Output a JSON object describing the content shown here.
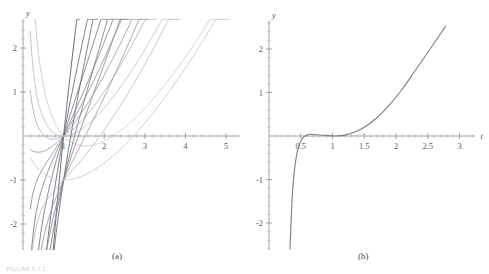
{
  "figure": {
    "caption_a": "(a)",
    "caption_b": "(b)",
    "footnote": "FIGURE 9.1.1"
  },
  "colors": {
    "axis": "#8c8c8c",
    "tick_label": "#5a5a5a",
    "curve_dark": "#6f6f7a",
    "curve_mid": "#8e8e99",
    "curve_light": "#b9b9c2",
    "curve_lighter": "#cfcfd6"
  },
  "chart_data": [
    {
      "type": "line",
      "panel": "(a)",
      "title": "",
      "xlabel": "t",
      "ylabel": "y",
      "xlim": [
        0.0,
        5.35
      ],
      "ylim": [
        -2.6,
        2.65
      ],
      "grid": false,
      "legend": null,
      "xticks": [
        1,
        2,
        3,
        4,
        5
      ],
      "xtick_labels": [
        "1",
        "2",
        "3",
        "4",
        "5"
      ],
      "yticks": [
        2,
        1,
        -1,
        -2
      ],
      "ytick_labels": [
        "2",
        "1",
        "-1",
        "-2"
      ],
      "xminor_step": 0.2,
      "yminor_step": 0.2,
      "description": "Family of solution curves through the points (1,0) and (1,-1)",
      "series": [
        {
          "name": "c = 0.00",
          "c": 0.0,
          "through": "(1,0)",
          "color": "#9a9aa4",
          "width": 1.0
        },
        {
          "name": "c = 0.25",
          "c": 0.25,
          "through": "(1,0)",
          "color": "#8f8f9a",
          "width": 1.0
        },
        {
          "name": "c = 0.50",
          "c": 0.5,
          "through": "(1,0)",
          "color": "#858590",
          "width": 1.0
        },
        {
          "name": "c = 1.00",
          "c": 1.0,
          "through": "(1,0)",
          "color": "#7b7b86",
          "width": 1.0
        },
        {
          "name": "c = 2.00",
          "c": 2.0,
          "through": "(1,0)",
          "color": "#72727d",
          "width": 1.0
        },
        {
          "name": "c = 4.00",
          "c": 4.0,
          "through": "(1,0)",
          "color": "#6a6a75",
          "width": 1.0
        },
        {
          "name": "c = -0.25",
          "c": -0.25,
          "through": "(1,0)",
          "color": "#b4b4bd",
          "width": 1.0
        },
        {
          "name": "c = -0.50",
          "c": -0.5,
          "through": "(1,0)",
          "color": "#c2c2ca",
          "width": 1.0
        },
        {
          "name": "c = -1.00",
          "c": -1.0,
          "through": "(1,0)",
          "color": "#cdcdd4",
          "width": 1.0
        },
        {
          "name": "d = 0.00",
          "c": 0.0,
          "through": "(1,-1)",
          "color": "#9a9aa4",
          "width": 1.0
        },
        {
          "name": "d = 0.50",
          "c": 0.5,
          "through": "(1,-1)",
          "color": "#8b8b96",
          "width": 1.0
        },
        {
          "name": "d = 1.00",
          "c": 1.0,
          "through": "(1,-1)",
          "color": "#7f7f8a",
          "width": 1.0
        },
        {
          "name": "d = 2.00",
          "c": 2.0,
          "through": "(1,-1)",
          "color": "#73737e",
          "width": 1.0
        },
        {
          "name": "d = -0.50",
          "c": -0.5,
          "through": "(1,-1)",
          "color": "#bcbcc4",
          "width": 1.0
        },
        {
          "name": "d = -1.00",
          "c": -1.0,
          "through": "(1,-1)",
          "color": "#c8c8d0",
          "width": 1.0
        }
      ]
    },
    {
      "type": "line",
      "panel": "(b)",
      "title": "",
      "xlabel": "t",
      "ylabel": "y",
      "xlim": [
        0.0,
        3.25
      ],
      "ylim": [
        -2.6,
        2.65
      ],
      "grid": false,
      "legend": null,
      "xticks": [
        0.5,
        1,
        1.5,
        2,
        2.5,
        3
      ],
      "xtick_labels": [
        "0.5",
        "1",
        "1.5",
        "2",
        "2.5",
        "3"
      ],
      "yticks": [
        2,
        1,
        -1,
        -2
      ],
      "ytick_labels": [
        "2",
        "1",
        "-1",
        "-2"
      ],
      "xminor_step": 0.1,
      "yminor_step": 0.2,
      "description": "Single solution curve: steep negative asymptote near t = 0.35, flat through t = 0.5 to 1.2, then rising to y = 2.5 at t = 2.8",
      "points": [
        {
          "t": 0.33,
          "y": -2.6
        },
        {
          "t": 0.35,
          "y": -1.9
        },
        {
          "t": 0.37,
          "y": -1.3
        },
        {
          "t": 0.4,
          "y": -0.8
        },
        {
          "t": 0.43,
          "y": -0.48
        },
        {
          "t": 0.47,
          "y": -0.23
        },
        {
          "t": 0.52,
          "y": -0.07
        },
        {
          "t": 0.58,
          "y": 0.01
        },
        {
          "t": 0.65,
          "y": 0.04
        },
        {
          "t": 0.75,
          "y": 0.03
        },
        {
          "t": 0.9,
          "y": 0.01
        },
        {
          "t": 1.05,
          "y": 0.0
        },
        {
          "t": 1.2,
          "y": 0.02
        },
        {
          "t": 1.35,
          "y": 0.09
        },
        {
          "t": 1.5,
          "y": 0.2
        },
        {
          "t": 1.7,
          "y": 0.42
        },
        {
          "t": 1.9,
          "y": 0.72
        },
        {
          "t": 2.1,
          "y": 1.08
        },
        {
          "t": 2.3,
          "y": 1.5
        },
        {
          "t": 2.5,
          "y": 1.92
        },
        {
          "t": 2.65,
          "y": 2.24
        },
        {
          "t": 2.78,
          "y": 2.52
        }
      ],
      "series": [
        {
          "name": "solution",
          "color": "#7b7b86",
          "width": 1.1
        }
      ]
    }
  ]
}
